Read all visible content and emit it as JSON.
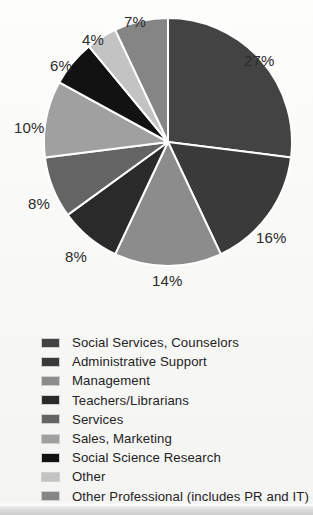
{
  "chart_data": {
    "type": "pie",
    "title": "",
    "subtitle": "",
    "xlabel": "",
    "ylabel": "",
    "legend_position": "bottom",
    "grid": false,
    "value_suffix": "%",
    "start_angle_deg": 0,
    "direction": "clockwise",
    "categories": [
      "Social Services, Counselors",
      "Administrative Support",
      "Management",
      "Teachers/Librarians",
      "Services",
      "Sales, Marketing",
      "Social Science Research",
      "Other",
      "Other Professional (includes PR and IT)"
    ],
    "values": [
      27,
      16,
      14,
      8,
      8,
      10,
      6,
      4,
      7
    ],
    "slice_labels": [
      "27%",
      "16%",
      "14%",
      "8%",
      "8%",
      "10%",
      "6%",
      "4%",
      "7%"
    ],
    "colors": [
      "#434343",
      "#3a3a3a",
      "#8c8c8c",
      "#2a2a2a",
      "#646464",
      "#a0a0a0",
      "#121212",
      "#c3c3c3",
      "#858585"
    ],
    "slice_divider_color": "#ffffff"
  },
  "labels": {
    "p27": "27%",
    "p16": "16%",
    "p14": "14%",
    "p8a": "8%",
    "p8b": "8%",
    "p10": "10%",
    "p6": "6%",
    "p4": "4%",
    "p7": "7%"
  },
  "legend": {
    "items": [
      {
        "label": "Social Services, Counselors",
        "color": "#434343"
      },
      {
        "label": "Administrative Support",
        "color": "#3a3a3a"
      },
      {
        "label": "Management",
        "color": "#8c8c8c"
      },
      {
        "label": "Teachers/Librarians",
        "color": "#2a2a2a"
      },
      {
        "label": "Services",
        "color": "#646464"
      },
      {
        "label": "Sales, Marketing",
        "color": "#a0a0a0"
      },
      {
        "label": "Social Science Research",
        "color": "#121212"
      },
      {
        "label": "Other",
        "color": "#c3c3c3"
      },
      {
        "label": "Other Professional (includes PR and IT)",
        "color": "#858585"
      }
    ]
  }
}
